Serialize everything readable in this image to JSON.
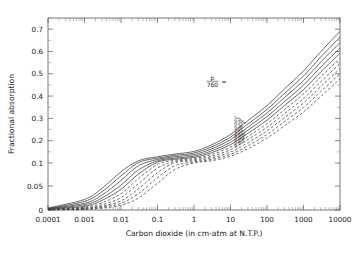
{
  "chart_data": {
    "type": "line",
    "title": "",
    "xlabel": "Carbon dioxide (in cm-atm at N.T.P.)",
    "ylabel": "Fractional absorption",
    "xscale": "log",
    "yscale": "piecewise-linear",
    "xlim": [
      0.0001,
      10000
    ],
    "ylim": [
      0,
      0.75
    ],
    "grid": false,
    "legend_position": "inline-curve-labels",
    "xticks": [
      0.0001,
      0.001,
      0.01,
      0.1,
      1,
      10,
      100,
      1000,
      10000
    ],
    "xtick_labels": [
      "0.0001",
      "0.001",
      "0.01",
      "0.1",
      "1",
      "10",
      "100",
      "1000",
      "10000"
    ],
    "yticks": [
      0,
      0.05,
      0.1,
      0.2,
      0.3,
      0.4,
      0.5,
      0.6,
      0.7
    ],
    "ytick_labels": [
      "0",
      "0.05",
      "0.1",
      "0.2",
      "0.3",
      "0.4",
      "0.5",
      "0.6",
      "0.7"
    ],
    "yminor": [
      0.15,
      0.25,
      0.35,
      0.45,
      0.55,
      0.65,
      0.75
    ],
    "annotation": "p/760 =",
    "annotation_numerator": "p",
    "annotation_denominator": "760",
    "annotation_equals": "=",
    "series": [
      {
        "name": "1",
        "label": "1",
        "style": "solid",
        "x": [
          0.0001,
          0.001,
          0.003,
          0.01,
          0.03,
          0.1,
          0.3,
          1,
          3,
          10,
          30,
          100,
          300,
          1000,
          3000,
          10000
        ],
        "y": [
          0.004,
          0.022,
          0.045,
          0.081,
          0.11,
          0.128,
          0.14,
          0.152,
          0.181,
          0.228,
          0.29,
          0.357,
          0.432,
          0.512,
          0.6,
          0.69
        ]
      },
      {
        "name": "0.5",
        "label": "0.5",
        "style": "solid",
        "x": [
          0.0001,
          0.001,
          0.003,
          0.01,
          0.03,
          0.1,
          0.3,
          1,
          3,
          10,
          30,
          100,
          300,
          1000,
          3000,
          10000
        ],
        "y": [
          0.003,
          0.018,
          0.038,
          0.072,
          0.102,
          0.122,
          0.134,
          0.145,
          0.172,
          0.216,
          0.275,
          0.34,
          0.412,
          0.49,
          0.576,
          0.664
        ]
      },
      {
        "name": "0.25",
        "label": "0.25",
        "style": "solid",
        "x": [
          0.0001,
          0.001,
          0.003,
          0.01,
          0.03,
          0.1,
          0.3,
          1,
          3,
          10,
          30,
          100,
          300,
          1000,
          3000,
          10000
        ],
        "y": [
          0.0025,
          0.014,
          0.031,
          0.062,
          0.094,
          0.116,
          0.128,
          0.138,
          0.163,
          0.205,
          0.261,
          0.324,
          0.393,
          0.469,
          0.553,
          0.639
        ]
      },
      {
        "name": "0.125",
        "label": "0.125",
        "style": "solid",
        "x": [
          0.0001,
          0.001,
          0.003,
          0.01,
          0.03,
          0.1,
          0.3,
          1,
          3,
          10,
          30,
          100,
          300,
          1000,
          3000,
          10000
        ],
        "y": [
          0.002,
          0.011,
          0.025,
          0.052,
          0.085,
          0.11,
          0.122,
          0.131,
          0.154,
          0.193,
          0.247,
          0.308,
          0.375,
          0.449,
          0.531,
          0.615
        ]
      },
      {
        "name": "0.06",
        "label": "0.06",
        "style": "solid",
        "x": [
          0.0001,
          0.001,
          0.003,
          0.01,
          0.03,
          0.1,
          0.3,
          1,
          3,
          10,
          30,
          100,
          300,
          1000,
          3000,
          10000
        ],
        "y": [
          0.0015,
          0.008,
          0.02,
          0.043,
          0.076,
          0.104,
          0.117,
          0.125,
          0.146,
          0.182,
          0.233,
          0.292,
          0.357,
          0.429,
          0.509,
          0.592
        ]
      },
      {
        "name": "0.03",
        "label": "0.03",
        "style": "dashed",
        "x": [
          0.0001,
          0.001,
          0.003,
          0.01,
          0.03,
          0.1,
          0.3,
          1,
          3,
          10,
          30,
          100,
          300,
          1000,
          3000,
          10000
        ],
        "y": [
          0.001,
          0.006,
          0.015,
          0.034,
          0.066,
          0.097,
          0.112,
          0.12,
          0.138,
          0.171,
          0.219,
          0.276,
          0.339,
          0.409,
          0.487,
          0.569
        ]
      },
      {
        "name": "0.015",
        "label": "0.015",
        "style": "dashed",
        "x": [
          0.0001,
          0.001,
          0.003,
          0.01,
          0.03,
          0.1,
          0.3,
          1,
          3,
          10,
          30,
          100,
          300,
          1000,
          3000,
          10000
        ],
        "y": [
          0.0008,
          0.0045,
          0.011,
          0.026,
          0.055,
          0.089,
          0.107,
          0.115,
          0.13,
          0.16,
          0.205,
          0.26,
          0.321,
          0.389,
          0.465,
          0.546
        ]
      },
      {
        "name": "0.008",
        "label": "0.008",
        "style": "dashed",
        "x": [
          0.0001,
          0.001,
          0.003,
          0.01,
          0.03,
          0.1,
          0.3,
          1,
          3,
          10,
          30,
          100,
          300,
          1000,
          3000,
          10000
        ],
        "y": [
          0.0006,
          0.0032,
          0.008,
          0.019,
          0.044,
          0.079,
          0.101,
          0.11,
          0.123,
          0.149,
          0.191,
          0.244,
          0.303,
          0.369,
          0.443,
          0.523
        ]
      },
      {
        "name": "0.004",
        "label": "0.004",
        "style": "dashed",
        "x": [
          0.0001,
          0.001,
          0.003,
          0.01,
          0.03,
          0.1,
          0.3,
          1,
          3,
          10,
          30,
          100,
          300,
          1000,
          3000,
          10000
        ],
        "y": [
          0.0004,
          0.0022,
          0.006,
          0.014,
          0.034,
          0.068,
          0.094,
          0.105,
          0.116,
          0.139,
          0.177,
          0.228,
          0.285,
          0.349,
          0.421,
          0.5
        ]
      },
      {
        "name": "0.002",
        "label": "0.002",
        "style": "dashed",
        "x": [
          0.0001,
          0.001,
          0.003,
          0.01,
          0.03,
          0.1,
          0.3,
          1,
          3,
          10,
          30,
          100,
          300,
          1000,
          3000,
          10000
        ],
        "y": [
          0.0003,
          0.0015,
          0.004,
          0.01,
          0.025,
          0.056,
          0.086,
          0.1,
          0.11,
          0.13,
          0.164,
          0.212,
          0.267,
          0.329,
          0.399,
          0.477
        ]
      }
    ]
  }
}
